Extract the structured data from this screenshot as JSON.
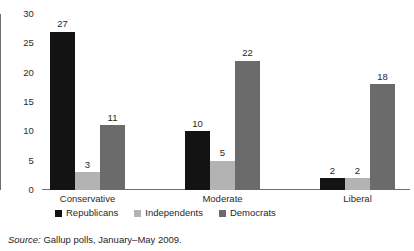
{
  "chart_data": {
    "type": "bar",
    "title": "",
    "subtitle": "",
    "xlabel": "",
    "ylabel": "",
    "categories": [
      "Conservative",
      "Moderate",
      "Liberal"
    ],
    "series": [
      {
        "name": "Republicans",
        "key": "rep",
        "color": "#131313",
        "values": [
          27,
          10,
          2
        ]
      },
      {
        "name": "Independents",
        "key": "ind",
        "color": "#b3b3b3",
        "values": [
          3,
          5,
          2
        ]
      },
      {
        "name": "Democrats",
        "key": "dem",
        "color": "#6b6b6b",
        "values": [
          11,
          22,
          18
        ]
      }
    ],
    "ylim": [
      0,
      30
    ],
    "yticks": [
      30,
      25,
      20,
      15,
      10,
      5,
      0
    ],
    "ytick_labels": [
      "30",
      "25",
      "20",
      "15",
      "10",
      "5",
      "0"
    ],
    "grid": false,
    "legend_position": "bottom-left",
    "data_labels": true,
    "bar_value_labels": {
      "Conservative": [
        "27",
        "3",
        "11"
      ],
      "Moderate": [
        "10",
        "5",
        "22"
      ],
      "Liberal": [
        "2",
        "2",
        "18"
      ]
    }
  },
  "legend": {
    "items": [
      {
        "label": "Republicans"
      },
      {
        "label": "Independents"
      },
      {
        "label": "Democrats"
      }
    ]
  },
  "source": {
    "prefix": "Source:",
    "text": " Gallup polls, January–May 2009."
  }
}
